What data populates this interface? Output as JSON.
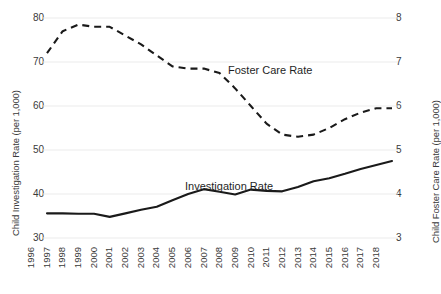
{
  "axes": {
    "y_left_title": "Child Investigation Rate (per 1,000)",
    "y_right_title": "Child Foster Care Rate (per 1,000)",
    "y_left_ticks": [
      "80",
      "70",
      "60",
      "50",
      "40",
      "30"
    ],
    "y_right_ticks": [
      "8",
      "7",
      "6",
      "5",
      "4",
      "3"
    ],
    "x_ticks": [
      "1996",
      "1997",
      "1998",
      "1999",
      "2000",
      "2001",
      "2002",
      "2003",
      "2004",
      "2005",
      "2006",
      "2007",
      "2008",
      "2009",
      "2010",
      "2011",
      "2012",
      "2013",
      "2014",
      "2015",
      "2016",
      "2017",
      "2018"
    ]
  },
  "labels": {
    "foster_care": "Foster Care Rate",
    "investigation": "Investigation Rate"
  },
  "colors": {
    "line": "#1a1a1a",
    "gridline": "#ebebeb",
    "text": "#3a3a3a",
    "background": "#ffffff"
  },
  "chart_data": {
    "type": "line",
    "title": "",
    "xlabel": "",
    "ylabel": "Child Investigation Rate (per 1,000)",
    "y2label": "Child Foster Care Rate (per 1,000)",
    "grid": true,
    "legend": "inline-annotation",
    "x": [
      1996,
      1997,
      1998,
      1999,
      2000,
      2001,
      2002,
      2003,
      2004,
      2005,
      2006,
      2007,
      2008,
      2009,
      2010,
      2011,
      2012,
      2013,
      2014,
      2015,
      2016,
      2017,
      2018
    ],
    "ylim": [
      30,
      80
    ],
    "y2lim": [
      3,
      8
    ],
    "series": [
      {
        "name": "Investigation Rate",
        "axis": "left",
        "style": "solid",
        "values": [
          35.6,
          35.6,
          35.5,
          35.5,
          34.8,
          35.6,
          36.4,
          37.1,
          38.6,
          40.0,
          41.1,
          40.5,
          39.9,
          41.0,
          40.7,
          40.6,
          41.6,
          42.9,
          43.6,
          44.6,
          45.7,
          46.6,
          47.5
        ]
      },
      {
        "name": "Foster Care Rate",
        "axis": "right",
        "style": "dashed",
        "values": [
          7.2,
          7.7,
          7.85,
          7.8,
          7.8,
          7.6,
          7.4,
          7.15,
          6.9,
          6.85,
          6.85,
          6.75,
          6.4,
          6.0,
          5.6,
          5.35,
          5.3,
          5.35,
          5.5,
          5.7,
          5.85,
          5.95,
          5.95
        ]
      }
    ]
  }
}
